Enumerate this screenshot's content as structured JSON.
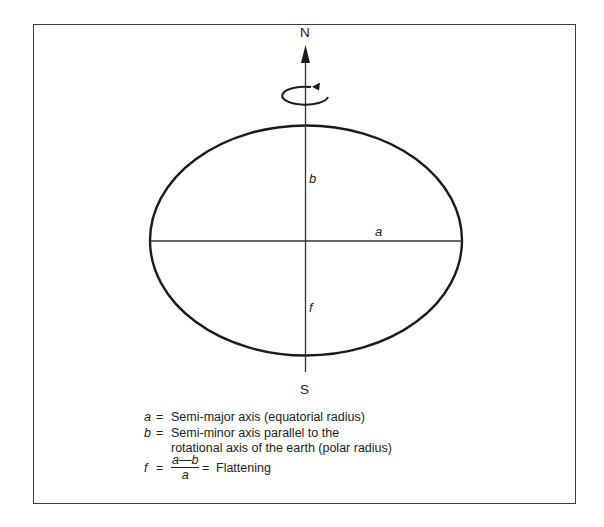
{
  "diagram": {
    "type": "earth-ellipsoid",
    "labels": {
      "north": "N",
      "south": "S",
      "semi_major": "a",
      "semi_minor": "b",
      "flattening": "f"
    },
    "geometry": {
      "center": [
        306,
        241
      ],
      "semi_major_px": 156,
      "semi_minor_px": 115,
      "axis_top_y": 46,
      "axis_bottom_y": 372,
      "rotation_ellipse": {
        "cx": 305,
        "cy": 95,
        "rx": 23,
        "ry": 9
      }
    },
    "colors": {
      "stroke": "#1a1a1a",
      "frame": "#3a3a3a",
      "background": "#ffffff"
    }
  },
  "legend": {
    "items": [
      {
        "symbol": "a",
        "equals": "=",
        "text": "Semi-major axis (equatorial radius)"
      },
      {
        "symbol": "b",
        "equals": "=",
        "text": "Semi-minor axis parallel to the"
      },
      {
        "symbol": "",
        "equals": "",
        "text": "rotational axis of the earth (polar radius)"
      }
    ],
    "formula": {
      "symbol": "f",
      "equals": "=",
      "numerator": "a—b",
      "denominator": "a",
      "equals2": "=",
      "text": "Flattening"
    }
  }
}
